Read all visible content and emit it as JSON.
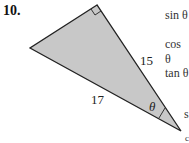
{
  "problem_number": "10.",
  "triangle": {
    "hypotenuse_label": "17",
    "side_label": "15",
    "angle_label": "θ",
    "right_angle_at": "top vertex",
    "fill_color": "#c8c8c8"
  },
  "functions": [
    "sin θ",
    "cos θ",
    "tan θ"
  ],
  "cutoff_chars": [
    "s",
    "c"
  ]
}
